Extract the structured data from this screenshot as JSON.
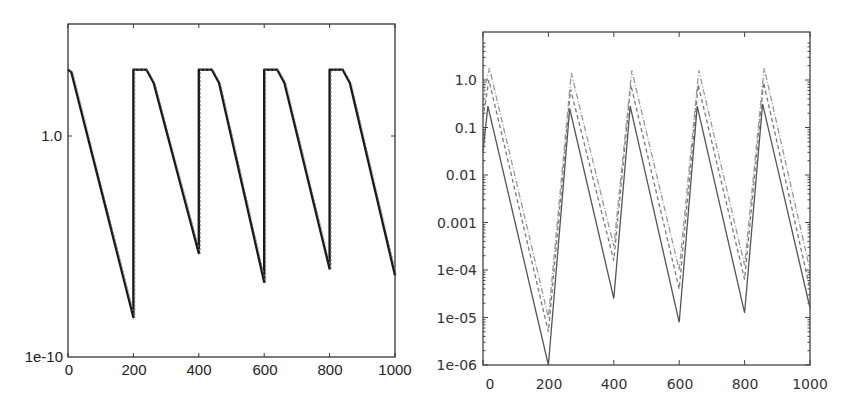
{
  "chart_data": [
    {
      "type": "line",
      "title": "",
      "xlabel": "",
      "ylabel": "",
      "yscale": "log",
      "xlim": [
        0,
        1000
      ],
      "ylim": [
        1e-10,
        100000.0
      ],
      "grid": false,
      "legend": null,
      "x_ticks": [
        "0",
        "200",
        "400",
        "600",
        "800",
        "1000"
      ],
      "y_ticks": [
        "1e-10",
        "1.0"
      ],
      "series": [
        {
          "name": "curve",
          "style": "solid",
          "color": "#1a1a1a",
          "x": [
            0,
            10,
            200,
            200,
            240,
            262,
            400,
            400,
            440,
            462,
            600,
            600,
            640,
            662,
            800,
            800,
            840,
            862,
            1000
          ],
          "y_log10": [
            3.0,
            2.9,
            -8.2,
            3.0,
            3.0,
            2.4,
            -5.3,
            3.0,
            3.0,
            2.4,
            -6.6,
            3.0,
            3.0,
            2.4,
            -6.0,
            3.0,
            3.0,
            2.4,
            -6.3
          ]
        }
      ]
    },
    {
      "type": "line",
      "title": "",
      "xlabel": "",
      "ylabel": "",
      "yscale": "log",
      "xlim": [
        0,
        1000
      ],
      "ylim": [
        1e-06,
        10
      ],
      "grid": false,
      "legend": null,
      "x_ticks": [
        "0",
        "200",
        "400",
        "600",
        "800",
        "1000"
      ],
      "y_ticks": [
        "1e-06",
        "1e-05",
        "1e-04",
        "0.001",
        "0.01",
        "0.1",
        "1.0"
      ],
      "series": [
        {
          "name": "series-1",
          "style": "solid",
          "color": "#555555",
          "x": [
            0,
            15,
            200,
            265,
            400,
            450,
            600,
            655,
            800,
            855,
            1000
          ],
          "y_log10": [
            -1.5,
            -0.55,
            -6.0,
            -0.6,
            -4.6,
            -0.55,
            -5.1,
            -0.55,
            -4.9,
            -0.5,
            -4.8
          ]
        },
        {
          "name": "series-2",
          "style": "dashed",
          "color": "#777777",
          "x": [
            0,
            18,
            200,
            268,
            400,
            452,
            600,
            658,
            800,
            858,
            1000
          ],
          "y_log10": [
            -0.8,
            0.0,
            -5.3,
            -0.2,
            -3.8,
            -0.1,
            -4.4,
            -0.1,
            -4.2,
            -0.05,
            -4.4
          ]
        },
        {
          "name": "series-3",
          "style": "dash-dot",
          "color": "#999999",
          "x": [
            0,
            20,
            200,
            270,
            400,
            455,
            600,
            660,
            800,
            860,
            1000
          ],
          "y_log10": [
            -0.3,
            0.25,
            -5.0,
            0.15,
            -3.5,
            0.2,
            -4.0,
            0.2,
            -3.9,
            0.25,
            -4.0
          ]
        }
      ]
    }
  ],
  "left_chart": {
    "x_tick_labels": [
      "0",
      "200",
      "400",
      "600",
      "800",
      "1000"
    ],
    "y_tick_labels": {
      "bottom": "1e-10",
      "mid": "1.0"
    }
  },
  "right_chart": {
    "x_tick_labels": [
      "0",
      "200",
      "400",
      "600",
      "800",
      "1000"
    ],
    "y_tick_labels": [
      "1.0",
      "0.1",
      "0.01",
      "0.001",
      "1e-04",
      "1e-05",
      "1e-06"
    ]
  }
}
